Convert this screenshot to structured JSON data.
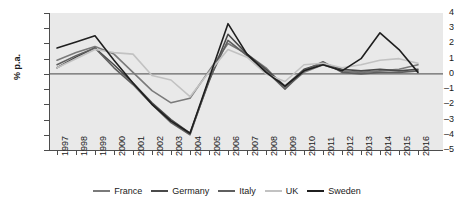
{
  "chart_data": {
    "type": "line",
    "title": "",
    "xlabel": "",
    "ylabel": "% p.a.",
    "ylim": [
      -5,
      4
    ],
    "yticks": [
      4,
      3,
      2,
      1,
      0,
      -1,
      -2,
      -3,
      -4,
      -5
    ],
    "ytick_labels": [
      "4",
      "3",
      "2",
      "1",
      "0",
      "–1",
      "–2",
      "–3",
      "–4",
      "–5"
    ],
    "grid": false,
    "zero_line": true,
    "background": "#e9e9e9",
    "legend_position": "bottom",
    "categories": [
      "1997",
      "1998",
      "1999",
      "2000",
      "2001",
      "2002",
      "2003",
      "2004",
      "2005",
      "2006",
      "2007",
      "2008",
      "2009",
      "2010",
      "2011",
      "2012",
      "2013",
      "2014",
      "2015",
      "2016"
    ],
    "series": [
      {
        "name": "France",
        "color": "#7a7a7a",
        "values": [
          0.9,
          1.4,
          1.8,
          1.3,
          0.1,
          -1.1,
          -1.9,
          -1.6,
          0.2,
          2.0,
          1.3,
          0.4,
          -0.9,
          0.1,
          0.6,
          0.2,
          0.1,
          0.2,
          0.3,
          0.6
        ]
      },
      {
        "name": "Germany",
        "color": "#4a4a4a",
        "values": [
          0.4,
          1.1,
          1.7,
          0.6,
          -0.6,
          -1.9,
          -3.0,
          -3.9,
          -0.5,
          2.6,
          1.3,
          0.3,
          -0.8,
          0.3,
          0.7,
          0.3,
          0.2,
          0.3,
          0.2,
          0.3
        ]
      },
      {
        "name": "Italy",
        "color": "#5f5f5f",
        "values": [
          0.6,
          1.2,
          1.7,
          0.4,
          -0.7,
          -2.0,
          -3.2,
          -4.0,
          -0.4,
          2.2,
          1.2,
          0.2,
          -1.0,
          0.2,
          0.8,
          0.1,
          0.0,
          0.1,
          0.1,
          0.2
        ]
      },
      {
        "name": "UK",
        "color": "#c2c2c2",
        "values": [
          0.4,
          1.0,
          1.6,
          1.4,
          1.3,
          -0.1,
          -0.4,
          -1.5,
          0.1,
          1.6,
          1.1,
          0.0,
          -0.5,
          0.6,
          0.7,
          0.4,
          0.6,
          0.9,
          1.0,
          0.7
        ]
      },
      {
        "name": "Sweden",
        "color": "#1f1f1f",
        "values": [
          1.7,
          2.1,
          2.5,
          0.9,
          -0.6,
          -2.0,
          -3.1,
          -3.9,
          -0.3,
          3.3,
          1.3,
          0.1,
          -0.8,
          0.2,
          0.6,
          0.2,
          1.0,
          2.7,
          1.6,
          0.1
        ]
      }
    ]
  }
}
